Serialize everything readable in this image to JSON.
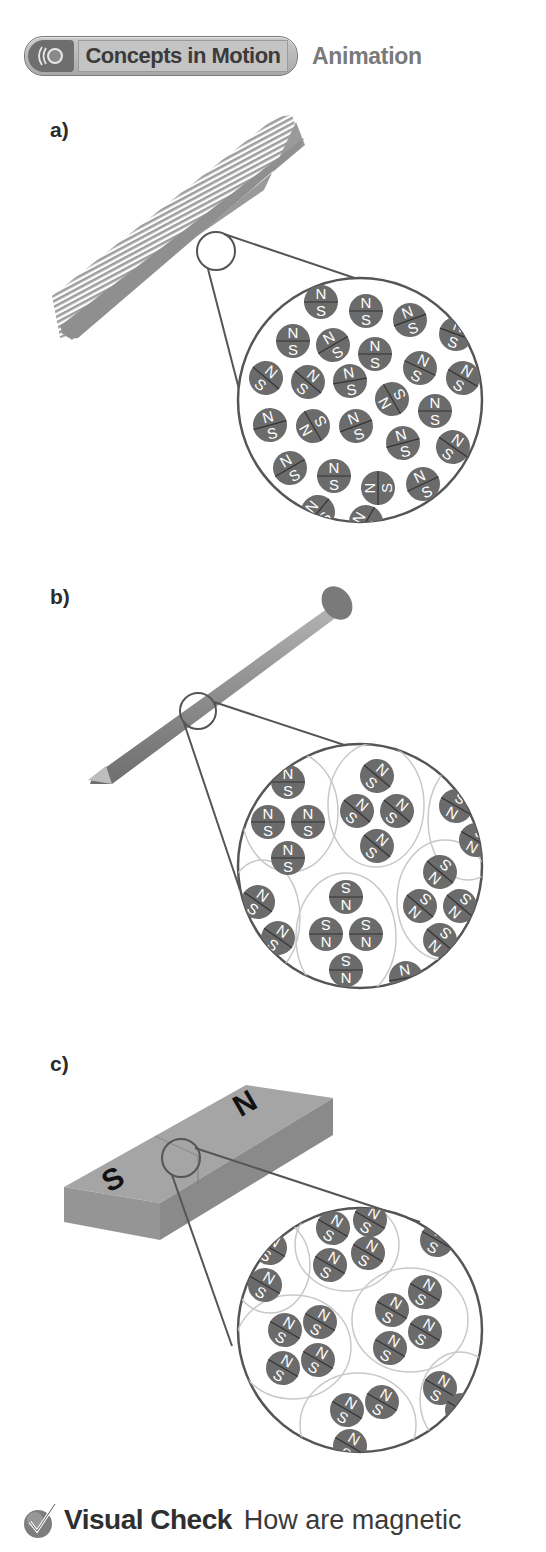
{
  "header": {
    "badge_label": "Concepts in Motion",
    "badge_icon": "motion-waves-icon",
    "tail_label": "Animation"
  },
  "panels": [
    {
      "label": "a)",
      "object": "comb",
      "description": "unmagnetized comb: magnetic domains randomly oriented",
      "pole_north": "N",
      "pole_south": "S"
    },
    {
      "label": "b)",
      "object": "nail",
      "description": "iron nail: domains grouped in clusters with random orientation",
      "pole_north": "N",
      "pole_south": "S"
    },
    {
      "label": "c)",
      "object": "bar-magnet",
      "description": "bar magnet: domains aligned in same direction",
      "magnet_north_label": "N",
      "magnet_south_label": "S",
      "pole_north": "N",
      "pole_south": "S"
    }
  ],
  "visual_check": {
    "icon": "checkmark-icon",
    "title": "Visual Check",
    "text": "How are magnetic"
  },
  "colors": {
    "domain_fill": "#6b6b6b",
    "object_gray": "#9c9c9c",
    "outline": "#555555",
    "cluster_ring": "#c8c8c8"
  }
}
